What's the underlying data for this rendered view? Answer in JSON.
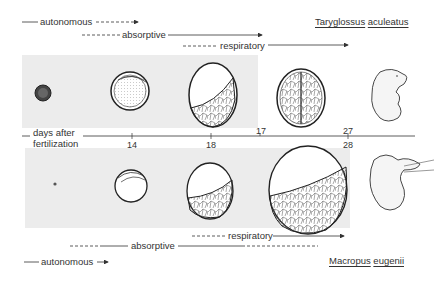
{
  "top": {
    "species": {
      "genus": "Taryglossus",
      "epithet": "aculeatus"
    },
    "phases": [
      {
        "label": "autonomous",
        "style": "solid-then-dashed-arrow"
      },
      {
        "label": "absorptive",
        "style": "dashed-then-solid-arrow"
      },
      {
        "label": "respiratory",
        "style": "dashed-then-solid-arrow"
      }
    ],
    "stages": [
      "early-ovum",
      "vesicle-day-14",
      "yolk-sac-day-18",
      "embryo-day-17-paired",
      "hatchling"
    ]
  },
  "axis": {
    "label_line1": "days after",
    "label_line2": "fertilization",
    "ticks_bottom": [
      "14",
      "18",
      "28"
    ],
    "ticks_top": [
      "17",
      "27"
    ]
  },
  "bottom": {
    "species": {
      "genus": "Macropus",
      "epithet": "eugenii"
    },
    "phases": [
      {
        "label": "respiratory",
        "style": "dashed-then-solid-arrow"
      },
      {
        "label": "absorptive",
        "style": "dashed-then-solid-then-dashed"
      },
      {
        "label": "autonomous",
        "style": "solid-then-arrow"
      }
    ],
    "stages": [
      "early-ovum",
      "vesicle",
      "yolk-sac",
      "large-yolk-sac",
      "neonate-at-teat"
    ]
  }
}
